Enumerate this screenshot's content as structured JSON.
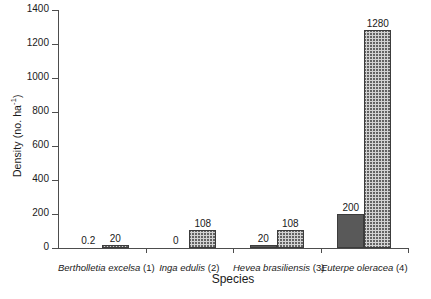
{
  "chart_data": {
    "type": "bar",
    "title": "",
    "xlabel": "Species",
    "ylabel": "Density (no. ha-1)",
    "ylabel_prefix": "Density (no. ha",
    "ylabel_exponent": "-1",
    "ylabel_suffix": ")",
    "ylim": [
      0,
      1400
    ],
    "yticks": [
      0,
      200,
      400,
      600,
      800,
      1000,
      1200,
      1400
    ],
    "ytick_labels": [
      "0",
      "200",
      "400",
      "600",
      "800",
      "1000",
      "1200",
      "1400"
    ],
    "grid": false,
    "legend": "none",
    "categories": [
      "Bertholletia excelsa (1)",
      "Inga edulis (2)",
      "Hevea brasiliensis (3)",
      "Euterpe oleracea (4)"
    ],
    "category_names": [
      "Bertholletia excelsa",
      "Inga edulis",
      "Hevea brasiliensis",
      "Euterpe oleracea"
    ],
    "category_numbers": [
      "(1)",
      "(2)",
      "(3)",
      "(4)"
    ],
    "series": [
      {
        "name": "series-1-solid",
        "fill": "solid-dark-gray",
        "color": "#595959",
        "values": [
          0.2,
          0,
          20,
          200
        ],
        "labels": [
          "0.2",
          "0",
          "20",
          "200"
        ]
      },
      {
        "name": "series-2-hatched",
        "fill": "cross-hatch-light-gray",
        "color": "#d2d2d2",
        "values": [
          20,
          108,
          108,
          1280
        ],
        "labels": [
          "20",
          "108",
          "108",
          "1280"
        ]
      }
    ]
  },
  "axis": {
    "x_title": "Species",
    "y_title_prefix": "Density (no. ha",
    "y_title_exponent": "-1",
    "y_title_suffix": ")"
  },
  "colors": {
    "axis": "#4d4d4d",
    "bar_solid": "#595959",
    "bar_hatch_bg": "#d2d2d2",
    "bar_edge": "#3c3c3c",
    "text": "#1a1a1a",
    "background": "#ffffff"
  }
}
